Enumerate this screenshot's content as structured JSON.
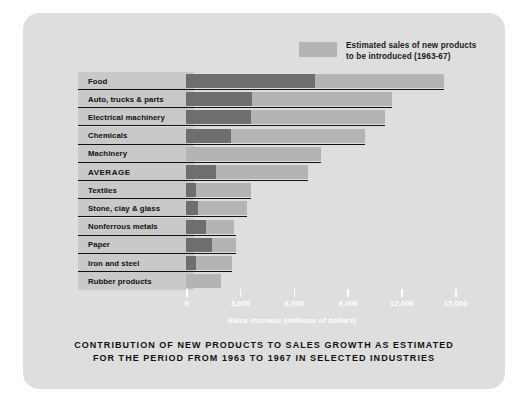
{
  "legend": {
    "swatch_color": "#b4b4b4",
    "text": "Estimated sales of new products\nto be introduced (1963-67)"
  },
  "caption": "CONTRIBUTION OF NEW PRODUCTS TO SALES GROWTH AS ESTIMATED\nFOR THE PERIOD FROM 1963 TO 1967 IN SELECTED INDUSTRIES",
  "colors": {
    "card_background": "#dedede",
    "label_band": "#c9c9c9",
    "bar_existing": "#6e6e6e",
    "bar_new_products": "#b4b4b4",
    "axis_text": "#ffffff",
    "rule": "#111111"
  },
  "chart_data": {
    "type": "bar",
    "orientation": "horizontal",
    "stacked": true,
    "title": "CONTRIBUTION OF NEW PRODUCTS TO SALES GROWTH AS ESTIMATED FOR THE PERIOD FROM 1963 TO 1967 IN SELECTED INDUSTRIES",
    "xlabel": "Sales increase (millions of dollars)",
    "ylabel": "",
    "xlim": [
      0,
      15000
    ],
    "xticks": [
      0,
      3000,
      6000,
      9000,
      12000,
      15000
    ],
    "xticklabels": [
      "0",
      "3,000",
      "6,000",
      "9,000",
      "12,000",
      "15,000"
    ],
    "grid": false,
    "legend_position": "top-right",
    "categories": [
      "Food",
      "Auto, trucks & parts",
      "Electrical machinery",
      "Chemicals",
      "Machinery",
      "AVERAGE",
      "Textiles",
      "Stone, clay & glass",
      "Nonferrous metals",
      "Paper",
      "Iron and steel",
      "Rubber products"
    ],
    "series": [
      {
        "name": "Sales increase from existing products",
        "color": "#6e6e6e",
        "values": [
          7200,
          3700,
          3600,
          2500,
          0,
          1700,
          550,
          650,
          1100,
          1450,
          550,
          0
        ]
      },
      {
        "name": "Estimated sales of new products to be introduced (1963-67)",
        "color": "#b4b4b4",
        "values": [
          7200,
          7800,
          7500,
          7500,
          7500,
          5100,
          3100,
          2750,
          1600,
          1350,
          2000,
          1950
        ]
      }
    ],
    "totals": [
      14400,
      11500,
      11100,
      10000,
      7500,
      6800,
      3650,
      3400,
      2700,
      2800,
      2550,
      1950
    ]
  }
}
